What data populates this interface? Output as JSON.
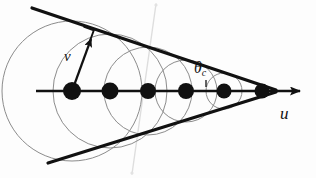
{
  "figure": {
    "background_color": "#fdfdfd",
    "width": 316,
    "height": 178
  },
  "labels": {
    "velocity_u": "u",
    "wave_speed_v": "v",
    "cherenkov_angle": "θ",
    "cherenkov_angle_subscript": "c"
  },
  "colors": {
    "ink": "#111111",
    "wavefront_stroke": "#8c8c8c",
    "artifact_stroke": "#d8d8d8"
  },
  "chart_data": {
    "type": "diagram",
    "axis": {
      "name": "particle-trajectory",
      "x1": 36,
      "y1": 91,
      "x2": 300,
      "y2": 91,
      "has_arrowhead": true,
      "arrow_label": "u"
    },
    "source_points": [
      {
        "index": 1,
        "cx": 72,
        "cy": 91,
        "r": 9.0
      },
      {
        "index": 2,
        "cx": 110,
        "cy": 91,
        "r": 8.5
      },
      {
        "index": 3,
        "cx": 148,
        "cy": 91,
        "r": 8.0
      },
      {
        "index": 4,
        "cx": 186,
        "cy": 91,
        "r": 8.0
      },
      {
        "index": 5,
        "cx": 224,
        "cy": 91,
        "r": 7.5
      },
      {
        "index": 6,
        "cx": 262,
        "cy": 91,
        "r": 7.5
      }
    ],
    "wavefronts": [
      {
        "index": 1,
        "cx": 72,
        "cy": 91,
        "r": 70
      },
      {
        "index": 2,
        "cx": 110,
        "cy": 91,
        "r": 57
      },
      {
        "index": 3,
        "cx": 148,
        "cy": 91,
        "r": 44
      },
      {
        "index": 4,
        "cx": 186,
        "cy": 91,
        "r": 31
      },
      {
        "index": 5,
        "cx": 224,
        "cy": 91,
        "r": 18
      },
      {
        "index": 6,
        "cx": 262,
        "cy": 91,
        "r": 6
      }
    ],
    "cone_lines": [
      {
        "name": "upper-envelope",
        "x1": 32,
        "y1": 8,
        "x2": 276,
        "y2": 90
      },
      {
        "name": "lower-envelope",
        "x1": 48,
        "y1": 163,
        "x2": 276,
        "y2": 92
      }
    ],
    "radius_vector": {
      "name": "wave-radius-v",
      "x1": 72,
      "y1": 91,
      "x2": 92,
      "y2": 36,
      "has_arrowhead": true,
      "label": "v"
    },
    "right_angle_marker": {
      "name": "right-angle-at-tangent",
      "cx": 90,
      "cy": 32,
      "size": 11
    },
    "angle_marker": {
      "name": "cherenkov-angle",
      "label": "theta_c",
      "vertex_x": 206,
      "vertex_y": 84
    },
    "artifact_line": {
      "x1": 156,
      "y1": 4,
      "x2": 132,
      "y2": 174
    }
  }
}
